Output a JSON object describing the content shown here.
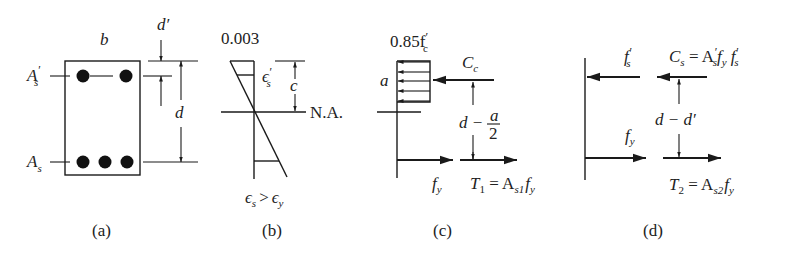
{
  "figure": {
    "panels": [
      {
        "id": "a",
        "caption": "(a)",
        "title": "Beam cross-section",
        "labels": {
          "width": "b",
          "compression_steel": "A",
          "compression_steel_sub": "s",
          "compression_steel_prime": "′",
          "tension_steel": "A",
          "tension_steel_sub": "s",
          "cover_depth": "d′",
          "effective_depth": "d"
        },
        "top_bars": 2,
        "bottom_bars": 3
      },
      {
        "id": "b",
        "caption": "(b)",
        "title": "Strain diagram",
        "labels": {
          "max_strain": "0.003",
          "comp_steel_strain": "ϵ",
          "comp_steel_strain_sub": "s",
          "comp_steel_strain_prime": "′",
          "na_depth": "c",
          "neutral_axis": "N.A.",
          "tension_strain": "ϵ",
          "tension_strain_sub": "s",
          "gt": ">",
          "yield_strain": "ϵ",
          "yield_strain_sub": "y"
        }
      },
      {
        "id": "c",
        "caption": "(c)",
        "title": "Concrete stress block and first couple",
        "labels": {
          "stress_block": "0.85f",
          "stress_block_sub": "c",
          "stress_block_prime": "′",
          "block_depth": "a",
          "compression_force": "C",
          "compression_force_sub": "c",
          "lever_arm_d": "d −",
          "lever_arm_num": "a",
          "lever_arm_den": "2",
          "steel_stress": "f",
          "steel_stress_sub": "y",
          "tension_force": "T",
          "tension_force_sub": "1",
          "tension_eq": " = A",
          "tension_eq_sub": "s1",
          "tension_eq_f": "f",
          "tension_eq_f_sub": "y"
        }
      },
      {
        "id": "d",
        "caption": "(d)",
        "title": "Steel couple",
        "labels": {
          "comp_steel_stress": "f",
          "comp_steel_stress_sub": "s",
          "comp_steel_stress_prime": "′",
          "comp_force": "C",
          "comp_force_sub": "s",
          "comp_force_eq": " = A",
          "comp_force_eq_prime": "′",
          "comp_force_eq_sub": "s",
          "comp_force_eq_f1": "f",
          "comp_force_eq_f1_sub": "y",
          "comp_force_eq_f2": " f",
          "comp_force_eq_f2_sub": "s",
          "comp_force_eq_f2_prime": "′",
          "lever_arm": "d − d′",
          "tension_steel_stress": "f",
          "tension_steel_stress_sub": "y",
          "tension_force": "T",
          "tension_force_sub": "2",
          "tension_eq": " = A",
          "tension_eq_sub": "s2",
          "tension_eq_f": "f",
          "tension_eq_f_sub": "y"
        }
      }
    ]
  }
}
